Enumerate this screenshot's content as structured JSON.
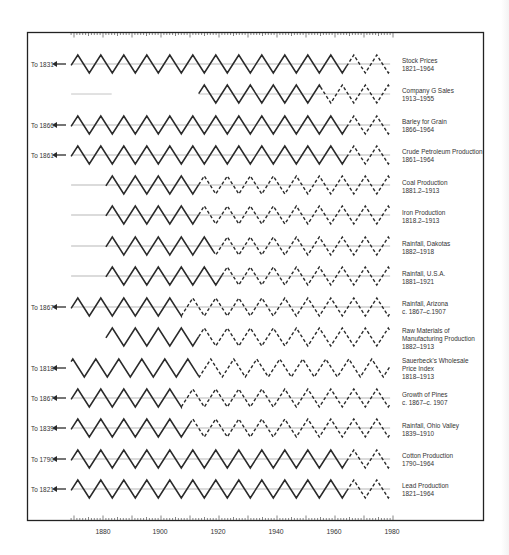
{
  "chart_data": {
    "type": "line",
    "title": "",
    "xlabel": "",
    "ylabel": "",
    "xlim": [
      1869,
      1982
    ],
    "x_ticks": [
      1880,
      1900,
      1920,
      1940,
      1960,
      1980
    ],
    "grid": false,
    "legend_position": "right, one label per row",
    "cycle_style": "idealized zigzag cycles; solid = observed period, dashed = projection",
    "series": [
      {
        "name": "Stock Prices",
        "range_label": "1831–1964",
        "left_label": "To 1831",
        "solid_from": 1869,
        "solid_to": 1964,
        "dashed_to": 1979,
        "baseline_from": 1869
      },
      {
        "name": "Company G Sales",
        "range_label": "1913–1955",
        "left_label": "",
        "solid_from": 1913,
        "solid_to": 1955,
        "dashed_to": 1979,
        "baseline_from": 1869,
        "baseline_faint_to": 1883
      },
      {
        "name": "Barley for Grain",
        "range_label": "1866–1964",
        "left_label": "To 1866",
        "solid_from": 1869,
        "solid_to": 1964,
        "dashed_to": 1979,
        "baseline_from": 1869
      },
      {
        "name": "Crude Petroleum Production",
        "range_label": "1861–1964",
        "left_label": "To 1861",
        "solid_from": 1869,
        "solid_to": 1964,
        "dashed_to": 1979,
        "baseline_from": 1869
      },
      {
        "name": "Coal Production",
        "range_label": "1881.2–1913",
        "left_label": "",
        "solid_from": 1881,
        "solid_to": 1913,
        "dashed_to": 1979,
        "baseline_from": 1869
      },
      {
        "name": "Iron Production",
        "range_label": "1818.2–1913",
        "left_label": "",
        "solid_from": 1881,
        "solid_to": 1913,
        "dashed_to": 1979,
        "baseline_from": 1869
      },
      {
        "name": "Rainfall, Dakotas",
        "range_label": "1882–1918",
        "left_label": "",
        "solid_from": 1881,
        "solid_to": 1918,
        "dashed_to": 1979,
        "baseline_from": 1869
      },
      {
        "name": "Rainfall, U.S.A.",
        "range_label": "1881–1921",
        "left_label": "",
        "solid_from": 1881,
        "solid_to": 1921,
        "dashed_to": 1979,
        "baseline_from": 1869
      },
      {
        "name": "Rainfall, Arizona",
        "range_label": "c. 1867–c.1907",
        "left_label": "To 1867",
        "solid_from": 1869,
        "solid_to": 1907,
        "dashed_to": 1979,
        "baseline_from": 1869
      },
      {
        "name": "Raw Materials of Manufacturing Production",
        "range_label": "1882–1913",
        "left_label": "",
        "solid_from": 1881,
        "solid_to": 1913,
        "dashed_to": 1979
      },
      {
        "name": "Sauerbeck's Wholesale Price Index",
        "range_label": "1818–1913",
        "left_label": "To 1818",
        "solid_from": 1869,
        "solid_to": 1913,
        "dashed_to": 1979
      },
      {
        "name": "Growth of Pines",
        "range_label": "c. 1867–c. 1907",
        "left_label": "To 1867",
        "solid_from": 1869,
        "solid_to": 1907,
        "dashed_to": 1979,
        "baseline_from": 1869
      },
      {
        "name": "Rainfall, Ohio Valley",
        "range_label": "1839–1910",
        "left_label": "To 1839",
        "solid_from": 1869,
        "solid_to": 1910,
        "dashed_to": 1979,
        "baseline_from": 1869
      },
      {
        "name": "Cotton Production",
        "range_label": "1790–1964",
        "left_label": "To 1790",
        "solid_from": 1869,
        "solid_to": 1964,
        "dashed_to": 1979,
        "baseline_from": 1869
      },
      {
        "name": "Lead Production",
        "range_label": "1821–1964",
        "left_label": "To 1821",
        "solid_from": 1869,
        "solid_to": 1964,
        "dashed_to": 1979,
        "baseline_from": 1869
      }
    ]
  },
  "rows": [
    {
      "left": "To 1831",
      "label1": "Stock Prices",
      "label2": "1821–1964"
    },
    {
      "left": "",
      "label1": "Company G Sales",
      "label2": "1913–1955"
    },
    {
      "left": "To 1866",
      "label1": "Barley for Grain",
      "label2": "1866–1964"
    },
    {
      "left": "To 1861",
      "label1": "Crude Petroleum Production",
      "label2": "1861–1964"
    },
    {
      "left": "",
      "label1": "Coal Production",
      "label2": "1881.2–1913"
    },
    {
      "left": "",
      "label1": "Iron Production",
      "label2": "1818.2–1913"
    },
    {
      "left": "",
      "label1": "Rainfall, Dakotas",
      "label2": "1882–1918"
    },
    {
      "left": "",
      "label1": "Rainfall, U.S.A.",
      "label2": "1881–1921"
    },
    {
      "left": "To 1867",
      "label1": "Rainfall, Arizona",
      "label2": "c. 1867–c.1907"
    },
    {
      "left": "",
      "label1": "Raw Materials of",
      "label2": "Manufacturing Production",
      "label3": "1882–1913"
    },
    {
      "left": "To 1818",
      "label1": "Sauerbeck's Wholesale",
      "label2": "Price Index",
      "label3": "1818–1913"
    },
    {
      "left": "To 1867",
      "label1": "Growth of Pines",
      "label2": "c. 1867–c. 1907"
    },
    {
      "left": "To 1839",
      "label1": "Rainfall, Ohio Valley",
      "label2": "1839–1910"
    },
    {
      "left": "To 1790",
      "label1": "Cotton Production",
      "label2": "1790–1964"
    },
    {
      "left": "To 1821",
      "label1": "Lead Production",
      "label2": "1821–1964"
    }
  ],
  "axis": {
    "ticks": [
      "1880",
      "1900",
      "1920",
      "1940",
      "1960",
      "1980"
    ]
  },
  "colors": {
    "ink": "#2a2a2a",
    "baseline": "#9a9a9a",
    "frame": "#222222"
  }
}
